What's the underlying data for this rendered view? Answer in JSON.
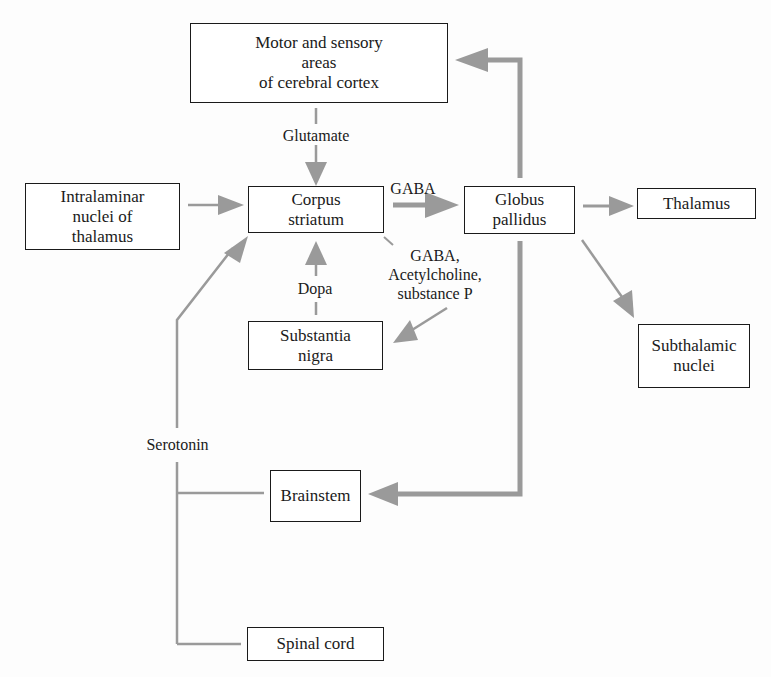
{
  "diagram": {
    "nodes": {
      "cortex": {
        "label": "Motor and sensory\nareas\nof cerebral cortex"
      },
      "intralaminar": {
        "label": "Intralaminar\nnuclei of\nthalamus"
      },
      "corpus_striatum": {
        "label": "Corpus\nstriatum"
      },
      "globus_pallidus": {
        "label": "Globus\npallidus"
      },
      "thalamus": {
        "label": "Thalamus"
      },
      "substantia_nigra": {
        "label": "Substantia\nnigra"
      },
      "subthalamic": {
        "label": "Subthalamic\nnuclei"
      },
      "brainstem": {
        "label": "Brainstem"
      },
      "spinal_cord": {
        "label": "Spinal cord"
      }
    },
    "edge_labels": {
      "glutamate": "Glutamate",
      "gaba": "GABA",
      "gaba_ach_subp": "GABA,\nAcetylcholine,\nsubstance P",
      "dopa": "Dopa",
      "serotonin": "Serotonin"
    },
    "edges": [
      {
        "from": "cortex",
        "to": "corpus_striatum",
        "label": "Glutamate"
      },
      {
        "from": "intralaminar",
        "to": "corpus_striatum",
        "label": ""
      },
      {
        "from": "corpus_striatum",
        "to": "globus_pallidus",
        "label": "GABA"
      },
      {
        "from": "corpus_striatum",
        "to": "substantia_nigra",
        "label": "GABA, Acetylcholine, substance P"
      },
      {
        "from": "substantia_nigra",
        "to": "corpus_striatum",
        "label": "Dopa"
      },
      {
        "from": "globus_pallidus",
        "to": "cortex",
        "label": ""
      },
      {
        "from": "globus_pallidus",
        "to": "thalamus",
        "label": ""
      },
      {
        "from": "globus_pallidus",
        "to": "subthalamic",
        "label": ""
      },
      {
        "from": "globus_pallidus",
        "to": "brainstem",
        "label": ""
      },
      {
        "from": "brainstem",
        "to": "corpus_striatum",
        "label": "Serotonin"
      },
      {
        "from": "spinal_cord",
        "to": "corpus_striatum",
        "label": "Serotonin"
      }
    ],
    "colors": {
      "arrow": "#9a9a9a",
      "box_border": "#1a1a1a",
      "text": "#1a1a1a"
    }
  }
}
